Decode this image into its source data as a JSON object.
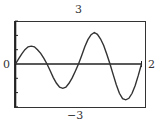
{
  "chart_data": {
    "type": "line",
    "title": "",
    "xlabel": "",
    "ylabel": "",
    "xlim": [
      0,
      2
    ],
    "ylim": [
      -3,
      3
    ],
    "grid": false,
    "labels": {
      "ymax": "3",
      "ymin": "−3",
      "xmin": "0",
      "xmax": "2"
    },
    "y_ticks_step": 1,
    "series": [
      {
        "name": "curve",
        "x": [
          0,
          0.05,
          0.1,
          0.15,
          0.2,
          0.25,
          0.3,
          0.35,
          0.4,
          0.45,
          0.5,
          0.55,
          0.6,
          0.65,
          0.7,
          0.75,
          0.8,
          0.85,
          0.9,
          0.95,
          1.0,
          1.05,
          1.1,
          1.15,
          1.2,
          1.25,
          1.3,
          1.35,
          1.4,
          1.45,
          1.5,
          1.55,
          1.6,
          1.65,
          1.7,
          1.75,
          1.8,
          1.85,
          1.9,
          1.95,
          2.0
        ],
        "y": [
          0,
          0.36,
          0.71,
          1.0,
          1.2,
          1.25,
          1.2,
          1.0,
          0.74,
          0.39,
          0,
          -0.47,
          -0.95,
          -1.35,
          -1.62,
          -1.7,
          -1.62,
          -1.35,
          -0.97,
          -0.5,
          0,
          0.6,
          1.2,
          1.7,
          2.05,
          2.2,
          2.08,
          1.75,
          1.3,
          0.68,
          0,
          -0.74,
          -1.45,
          -2.05,
          -2.42,
          -2.5,
          -2.4,
          -2.05,
          -1.5,
          -0.8,
          0
        ]
      }
    ]
  }
}
